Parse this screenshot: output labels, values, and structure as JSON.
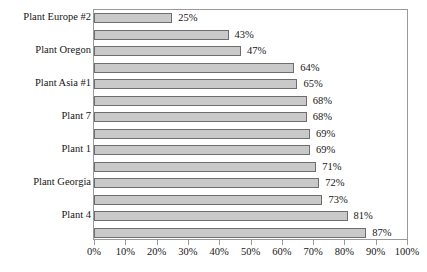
{
  "chart_data": {
    "type": "bar",
    "orientation": "horizontal",
    "title": "",
    "subtitle": "",
    "xlabel": "",
    "ylabel": "",
    "xlim": [
      0,
      100
    ],
    "grid": false,
    "legend": null,
    "value_suffix": "%",
    "xticks": [
      "0%",
      "10%",
      "20%",
      "30%",
      "40%",
      "50%",
      "60%",
      "70%",
      "80%",
      "90%",
      "100%"
    ],
    "xtick_values": [
      0,
      10,
      20,
      30,
      40,
      50,
      60,
      70,
      80,
      90,
      100
    ],
    "categories": [
      "Plant Europe #2",
      "",
      "Plant Oregon",
      "",
      "Plant Asia #1",
      "",
      "Plant 7",
      "",
      "Plant 1",
      "",
      "Plant Georgia",
      "",
      "Plant 4",
      ""
    ],
    "values": [
      25,
      43,
      47,
      64,
      65,
      68,
      68,
      69,
      69,
      71,
      72,
      73,
      81,
      87
    ],
    "data_labels": [
      "25%",
      "43%",
      "47%",
      "64%",
      "65%",
      "68%",
      "68%",
      "69%",
      "69%",
      "71%",
      "72%",
      "73%",
      "81%",
      "87%"
    ],
    "bar_color": "#c9c9c9",
    "bar_border_color": "#6e6e6e",
    "axis_color": "#9a9a9a",
    "text_color": "#161616",
    "background": "#ffffff"
  }
}
